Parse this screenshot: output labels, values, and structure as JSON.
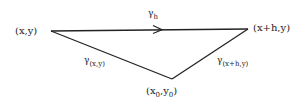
{
  "diagram": {
    "vertices": {
      "start": {
        "label": "(x,y)",
        "x": 51,
        "y": 31
      },
      "end": {
        "label": "(x+h,y)",
        "x": 248,
        "y": 29
      },
      "base": {
        "label_main_x": "(x",
        "label_sub_x": "0",
        "label_mid": ",y",
        "label_sub_y": "0",
        "label_close": ")",
        "x": 172,
        "y": 79
      }
    },
    "paths": {
      "gamma_h": {
        "symbol": "γ",
        "subscript": "h"
      },
      "gamma_xy": {
        "symbol": "γ",
        "subscript": "(x,y)"
      },
      "gamma_xhy": {
        "symbol": "γ",
        "subscript": "(x+h,y)"
      }
    },
    "colors": {
      "stroke": "#222222",
      "background": "#ffffff"
    }
  }
}
